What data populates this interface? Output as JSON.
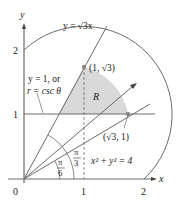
{
  "diagram": {
    "axes": {
      "x_label": "x",
      "y_label": "y",
      "origin_label": "0",
      "x_ticks": [
        "1",
        "2"
      ],
      "y_ticks": [
        "1",
        "2"
      ]
    },
    "curves": {
      "line_steep": "y = √3x",
      "line_horizontal": "y = 1, or",
      "line_horizontal_polar": "r = csc θ",
      "circle": "x² + y² = 4"
    },
    "points": {
      "upper": "(1, √3)",
      "lower": "(√3, 1)"
    },
    "region_label": "R",
    "angles": {
      "pi_over_6_num": "π",
      "pi_over_6_den": "6",
      "pi_over_3_num": "π",
      "pi_over_3_den": "3"
    },
    "colors": {
      "line": "#6b6b6b",
      "region_fill": "#d9d9d9",
      "point": "#888888"
    }
  }
}
